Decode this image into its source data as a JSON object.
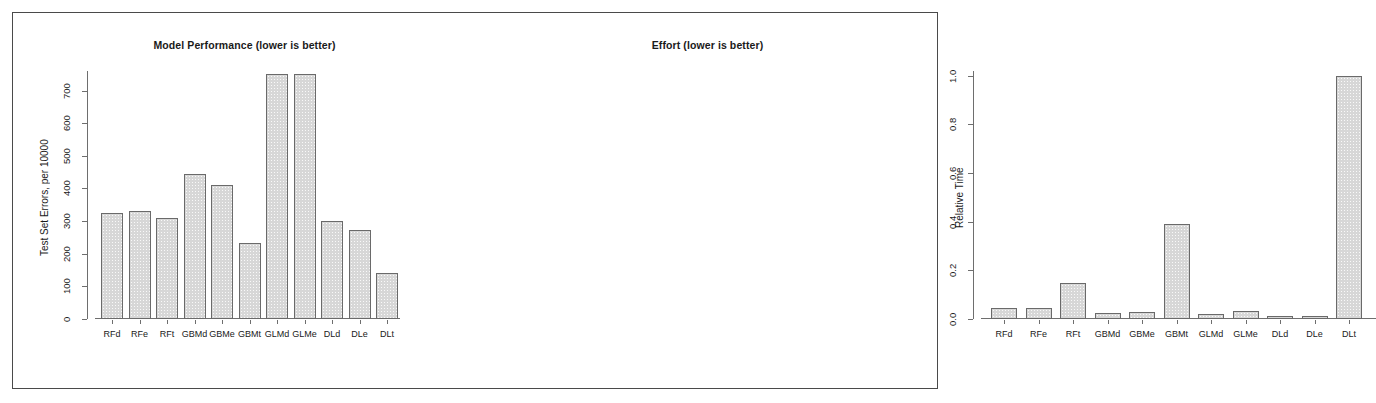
{
  "figure": {
    "background_color": "#ffffff",
    "frame_color": "#4a4a4a",
    "bar_fill_color": "#d7d7d7",
    "bar_border_color": "#6a6a6a",
    "axis_color": "#6e6e6e"
  },
  "chart_data": [
    {
      "type": "bar",
      "title": "Model Performance (lower is better)",
      "xlabel": "",
      "ylabel": "Test Set Errors, per 10000",
      "categories": [
        "RFd",
        "RFe",
        "RFt",
        "GBMd",
        "GBMe",
        "GBMt",
        "GLMd",
        "GLMe",
        "DLd",
        "DLe",
        "DLt"
      ],
      "values": [
        325,
        330,
        310,
        445,
        410,
        232,
        750,
        752,
        300,
        272,
        140
      ],
      "ylim": [
        0,
        760
      ],
      "yticks": [
        0,
        100,
        200,
        300,
        400,
        500,
        600,
        700
      ],
      "ytick_labels": [
        "0",
        "100",
        "200",
        "300",
        "400",
        "500",
        "600",
        "700"
      ],
      "grid": false,
      "legend": "none"
    },
    {
      "type": "bar",
      "title": "Effort (lower is better)",
      "xlabel": "",
      "ylabel": "Relative Time",
      "categories": [
        "RFd",
        "RFe",
        "RFt",
        "GBMd",
        "GBMe",
        "GBMt",
        "GLMd",
        "GLMe",
        "DLd",
        "DLe",
        "DLt"
      ],
      "values": [
        0.047,
        0.047,
        0.15,
        0.025,
        0.027,
        0.39,
        0.022,
        0.032,
        0.012,
        0.012,
        1.0
      ],
      "ylim": [
        0,
        1.02
      ],
      "yticks": [
        0.0,
        0.2,
        0.4,
        0.6,
        0.8,
        1.0
      ],
      "ytick_labels": [
        "0.0",
        "0.2",
        "0.4",
        "0.6",
        "0.8",
        "1.0"
      ],
      "grid": false,
      "legend": "none"
    }
  ]
}
